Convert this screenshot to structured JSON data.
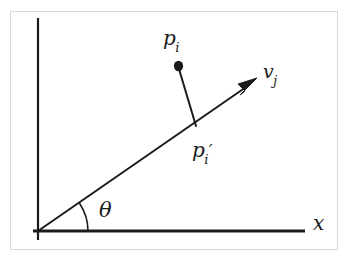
{
  "figure": {
    "background_color": "#ffffff",
    "stroke_color": "#1a1a1a",
    "frame_color": "#d8d8d8",
    "axes": {
      "x_axis_label": "x",
      "y_axis_label": "",
      "origin_label": ""
    },
    "labels": {
      "point_pi": {
        "base": "p",
        "subscript": "i",
        "prime": ""
      },
      "point_pi_prime": {
        "base": "p",
        "subscript": "i",
        "prime": "′"
      },
      "vector_vj": {
        "base": "v",
        "subscript": "j",
        "prime": ""
      },
      "angle_theta": "θ"
    },
    "geometry": {
      "origin": [
        38,
        231
      ],
      "y_axis_top": [
        38,
        18
      ],
      "y_axis_bottom": [
        38,
        240
      ],
      "x_axis_start": [
        33,
        231
      ],
      "x_axis_end": [
        305,
        231
      ],
      "ray_start": [
        38,
        231
      ],
      "ray_tip": [
        256,
        80
      ],
      "point_pi": [
        178,
        66
      ],
      "point_pi_projection": [
        196,
        125
      ],
      "arc_radius": 50,
      "angle_degrees": 35
    }
  }
}
